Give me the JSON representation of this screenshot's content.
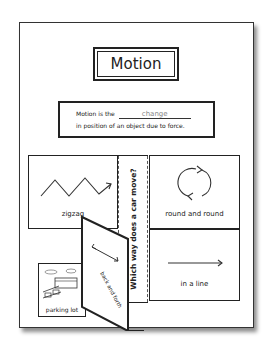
{
  "title": "Motion",
  "definition": {
    "prefix": "Motion is the",
    "answer": "change",
    "suffix": "in position of an object due to force."
  },
  "question": "Which way does a car move?",
  "cells": {
    "zigzag": "zigzag",
    "round": "round and round",
    "line": "in a line",
    "back_forth": "back and forth",
    "parking": "parking lot"
  },
  "icons": [
    "zigzag-arrow-icon",
    "circular-arrows-icon",
    "straight-arrow-icon",
    "double-arrow-icon",
    "parking-lot-picture"
  ]
}
